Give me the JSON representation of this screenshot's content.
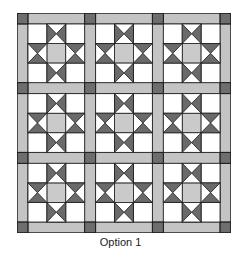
{
  "caption": "Option 1",
  "quilt": {
    "rows": 3,
    "cols": 3,
    "block_pattern": "sawtooth-star",
    "colors": {
      "background": "#ffffff",
      "sashing": "#c4c4c4",
      "cornerstone": "#6e6e6e",
      "star_point": "#6a6a6a",
      "star_center": "#cacaca",
      "outline": "#1a1a1a"
    }
  }
}
